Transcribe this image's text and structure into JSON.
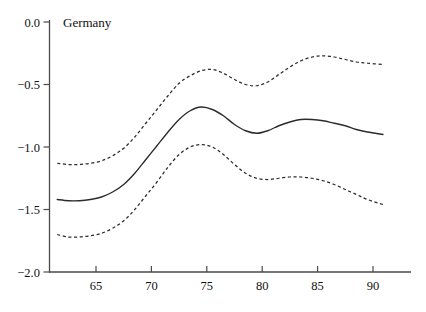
{
  "chart_data": {
    "type": "line",
    "title": "Germany",
    "xlabel": "",
    "ylabel": "",
    "xlim": [
      61.5,
      93.5
    ],
    "ylim": [
      -2.0,
      0.0
    ],
    "grid": false,
    "legend": "none",
    "x_ticks": [
      65,
      70,
      75,
      80,
      85,
      90
    ],
    "x_tick_labels": [
      "65",
      "70",
      "75",
      "80",
      "85",
      "90"
    ],
    "y_ticks": [
      0.0,
      -0.5,
      -1.0,
      -1.5,
      -2.0
    ],
    "y_tick_labels": [
      "0.0",
      "−0.5",
      "−1.0",
      "−1.5",
      "−2.0"
    ],
    "x": [
      61.5,
      62.5,
      63.5,
      64.5,
      65.5,
      66.5,
      67.5,
      68.5,
      69.5,
      70.5,
      71.5,
      72.5,
      73.5,
      74.5,
      75.5,
      76.5,
      77.5,
      78.5,
      79.5,
      80.5,
      81.5,
      82.5,
      83.5,
      84.5,
      85.5,
      86.5,
      87.5,
      88.5,
      89.5,
      90.9
    ],
    "series": [
      {
        "name": "estimate",
        "style": "solid",
        "values": [
          -1.42,
          -1.43,
          -1.43,
          -1.42,
          -1.4,
          -1.36,
          -1.3,
          -1.21,
          -1.1,
          -0.99,
          -0.88,
          -0.78,
          -0.71,
          -0.68,
          -0.7,
          -0.75,
          -0.82,
          -0.87,
          -0.89,
          -0.87,
          -0.83,
          -0.8,
          -0.78,
          -0.78,
          -0.79,
          -0.81,
          -0.83,
          -0.86,
          -0.88,
          -0.9
        ]
      },
      {
        "name": "upper-confidence-band",
        "style": "dashed",
        "values": [
          -1.13,
          -1.14,
          -1.14,
          -1.13,
          -1.11,
          -1.07,
          -1.01,
          -0.92,
          -0.81,
          -0.7,
          -0.59,
          -0.49,
          -0.43,
          -0.39,
          -0.38,
          -0.41,
          -0.46,
          -0.5,
          -0.51,
          -0.48,
          -0.42,
          -0.36,
          -0.31,
          -0.28,
          -0.27,
          -0.28,
          -0.3,
          -0.32,
          -0.33,
          -0.34
        ]
      },
      {
        "name": "lower-confidence-band",
        "style": "dashed",
        "values": [
          -1.7,
          -1.72,
          -1.72,
          -1.71,
          -1.69,
          -1.65,
          -1.59,
          -1.5,
          -1.39,
          -1.28,
          -1.16,
          -1.06,
          -1.0,
          -0.98,
          -1.0,
          -1.06,
          -1.14,
          -1.21,
          -1.25,
          -1.26,
          -1.25,
          -1.24,
          -1.24,
          -1.25,
          -1.27,
          -1.3,
          -1.34,
          -1.38,
          -1.42,
          -1.46
        ]
      }
    ],
    "colors": {
      "line": "#2b2b2b",
      "axis": "#4a4a4a",
      "background": "#ffffff",
      "text": "#111111"
    }
  }
}
